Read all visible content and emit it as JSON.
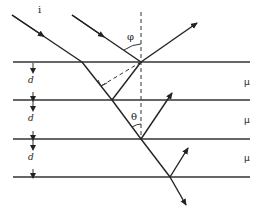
{
  "diagram": {
    "labels": {
      "incident": "i",
      "angle_incidence": "φ",
      "angle_refraction": "θ",
      "thickness": [
        "d",
        "d",
        "d"
      ],
      "medium": [
        "μ",
        "μ",
        "μ"
      ]
    },
    "interfaces_y": [
      62,
      100,
      139,
      177
    ],
    "colors": {
      "line": "#222222",
      "background": "#ffffff"
    }
  }
}
